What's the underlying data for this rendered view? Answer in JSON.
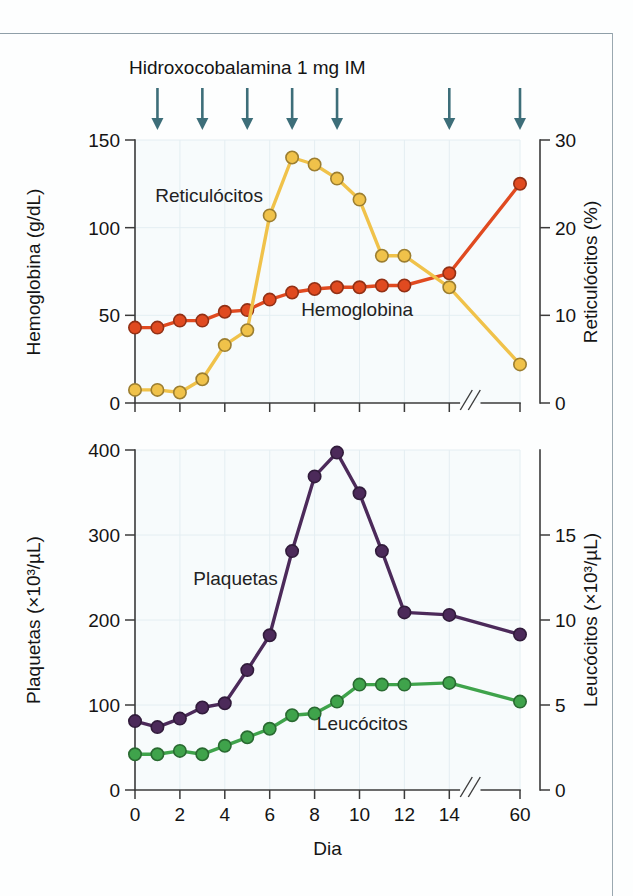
{
  "figure": {
    "annotation_title": "Hidroxocobalamina 1 mg IM",
    "xlabel": "Dia",
    "arrow_icon_name": "dose-arrow-icon"
  },
  "chart_data": [
    {
      "type": "line",
      "title": "Hidroxocobalamina 1 mg IM",
      "panel": "top",
      "xlabel": "Dia",
      "ylabel": "Hemoglobina (g/dL)",
      "y2label": "Reticulócitos (%)",
      "xlim": [
        0,
        16
      ],
      "ylim": [
        0,
        150
      ],
      "y2lim": [
        0,
        30
      ],
      "yticks": [
        0,
        50,
        100,
        150
      ],
      "y2ticks": [
        0,
        10,
        20,
        30
      ],
      "xticks": [
        0,
        2,
        4,
        6,
        8,
        10,
        12,
        14,
        60
      ],
      "xtick_labels": [
        "0",
        "2",
        "4",
        "6",
        "8",
        "10",
        "12",
        "14",
        "60"
      ],
      "axis_break": true,
      "grid": true,
      "legend_position": "inline-annotations",
      "annotations": [
        {
          "text": "Reticulócitos",
          "x": 2.0,
          "y": 118
        },
        {
          "text": "Hemoglobina",
          "x": 8.4,
          "y": 57
        }
      ],
      "dose_arrow_days": [
        1,
        3,
        5,
        7,
        9,
        14,
        60
      ],
      "series": [
        {
          "name": "Hemoglobina",
          "axis": "left",
          "unit": "g/dL",
          "color": "#E04A20",
          "x": [
            0,
            1,
            2,
            3,
            4,
            5,
            6,
            7,
            8,
            9,
            10,
            11,
            12,
            14,
            60
          ],
          "values": [
            43,
            43,
            47,
            47,
            52,
            53,
            59,
            63,
            65,
            66,
            66,
            67,
            67,
            74,
            125
          ]
        },
        {
          "name": "Reticulócitos",
          "axis": "right",
          "unit": "%",
          "color": "#F0C24A",
          "x": [
            0,
            1,
            2,
            3,
            4,
            5,
            6,
            7,
            8,
            9,
            10,
            11,
            12,
            14,
            60
          ],
          "values": [
            1.5,
            1.5,
            1.2,
            2.7,
            6.6,
            8.3,
            21.4,
            28.0,
            27.2,
            25.6,
            23.2,
            16.8,
            16.8,
            13.2,
            4.4
          ]
        }
      ]
    },
    {
      "type": "line",
      "panel": "bottom",
      "xlabel": "Dia",
      "ylabel": "Plaquetas (×10³/µL)",
      "y2label": "Leucócitos (×10³/µL)",
      "xlim": [
        0,
        16
      ],
      "ylim": [
        0,
        400
      ],
      "y2lim": [
        0,
        20
      ],
      "yticks": [
        0,
        100,
        200,
        300,
        400
      ],
      "y2ticks": [
        0,
        5,
        10,
        15
      ],
      "xticks": [
        0,
        2,
        4,
        6,
        8,
        10,
        12,
        14,
        60
      ],
      "xtick_labels": [
        "0",
        "2",
        "4",
        "6",
        "8",
        "10",
        "12",
        "14",
        "60"
      ],
      "axis_break": true,
      "grid": true,
      "legend_position": "inline-annotations",
      "annotations": [
        {
          "text": "Plaquetas",
          "x": 4.2,
          "y": 252
        },
        {
          "text": "Leucócitos",
          "x": 9.0,
          "y": 80
        }
      ],
      "series": [
        {
          "name": "Plaquetas",
          "axis": "left",
          "unit": "×10³/µL",
          "color": "#4C2A5A",
          "x": [
            0,
            1,
            2,
            3,
            4,
            5,
            6,
            7,
            8,
            9,
            10,
            11,
            12,
            14,
            60
          ],
          "values": [
            81,
            74,
            84,
            97,
            102,
            141,
            182,
            281,
            369,
            397,
            349,
            281,
            209,
            206,
            183
          ]
        },
        {
          "name": "Leucócitos",
          "axis": "right",
          "unit": "×10³/µL",
          "color": "#3FA34B",
          "x": [
            0,
            1,
            2,
            3,
            4,
            5,
            6,
            7,
            8,
            9,
            10,
            11,
            12,
            14,
            60
          ],
          "values": [
            2.1,
            2.1,
            2.3,
            2.1,
            2.6,
            3.1,
            3.6,
            4.4,
            4.5,
            5.2,
            6.2,
            6.2,
            6.2,
            6.3,
            5.2
          ]
        }
      ]
    }
  ],
  "colors": {
    "hemoglobina": "#E04A20",
    "reticulocitos": "#F0C24A",
    "plaquetas": "#4C2A5A",
    "leucocitos": "#3FA34B",
    "arrow": "#3D6E79",
    "axis": "#3B3B3B",
    "grid": "#E4EEF2",
    "plot_background": "#F7FBFC"
  },
  "labels": {
    "top_left_axis": "Hemoglobina (g/dL)",
    "top_right_axis": "Reticulócitos (%)",
    "bottom_left_axis": "Plaquetas (×10³/µL)",
    "bottom_right_axis": "Leucócitos (×10³/µL)",
    "top_series_a": "Reticulócitos",
    "top_series_b": "Hemoglobina",
    "bottom_series_a": "Plaquetas",
    "bottom_series_b": "Leucócitos",
    "x_axis": "Dia",
    "title": "Hidroxocobalamina 1 mg IM",
    "ticks_top_left": [
      "0",
      "50",
      "100",
      "150"
    ],
    "ticks_top_right": [
      "0",
      "10",
      "20",
      "30"
    ],
    "ticks_bottom_left": [
      "0",
      "100",
      "200",
      "300",
      "400"
    ],
    "ticks_bottom_right": [
      "0",
      "5",
      "10",
      "15"
    ],
    "ticks_x": [
      "0",
      "2",
      "4",
      "6",
      "8",
      "10",
      "12",
      "14",
      "60"
    ]
  }
}
